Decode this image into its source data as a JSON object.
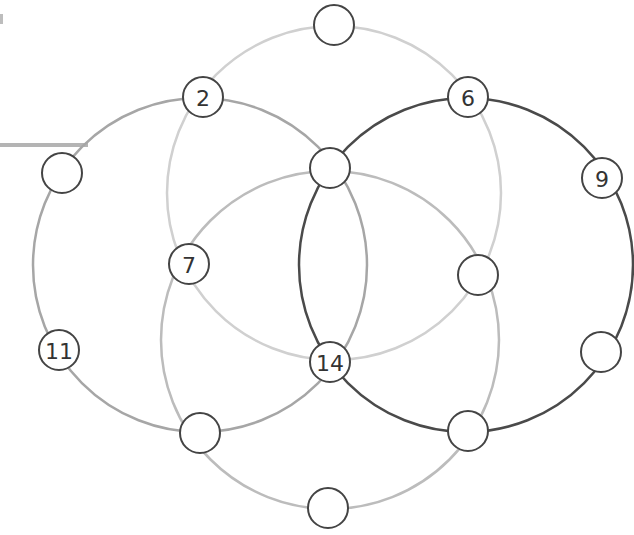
{
  "diagram": {
    "type": "magic-circles-puzzle",
    "canvas": {
      "width": 634,
      "height": 535,
      "background": "#ffffff"
    },
    "circles": [
      {
        "id": "top",
        "cx": 334,
        "cy": 193,
        "r": 167,
        "stroke": "#d0d0d0",
        "width": 2.5
      },
      {
        "id": "left",
        "cx": 200,
        "cy": 265,
        "r": 167,
        "stroke": "#a6a6a6",
        "width": 2.5
      },
      {
        "id": "bottom",
        "cx": 330,
        "cy": 340,
        "r": 169,
        "stroke": "#bcbcbc",
        "width": 2.5
      },
      {
        "id": "right",
        "cx": 466,
        "cy": 265,
        "r": 167,
        "stroke": "#4a4a4a",
        "width": 2.5
      }
    ],
    "stub_line": {
      "x1": 0,
      "y1": 145,
      "x2": 88,
      "y2": 145,
      "stroke": "#b4b4b4",
      "width": 4
    },
    "node_style": {
      "r": 20,
      "fill": "#ffffff",
      "stroke": "#444444",
      "width": 2
    },
    "nodes": [
      {
        "id": "n-top",
        "x": 334,
        "y": 25,
        "label": ""
      },
      {
        "id": "n-2",
        "x": 203,
        "y": 97,
        "label": "2"
      },
      {
        "id": "n-6",
        "x": 468,
        "y": 97,
        "label": "6"
      },
      {
        "id": "n-left",
        "x": 62,
        "y": 173,
        "label": ""
      },
      {
        "id": "n-center-top",
        "x": 330,
        "y": 168,
        "label": ""
      },
      {
        "id": "n-9",
        "x": 602,
        "y": 178,
        "label": "9"
      },
      {
        "id": "n-7",
        "x": 189,
        "y": 264,
        "label": "7"
      },
      {
        "id": "n-right-mid",
        "x": 478,
        "y": 275,
        "label": ""
      },
      {
        "id": "n-11",
        "x": 59,
        "y": 350,
        "label": "11"
      },
      {
        "id": "n-right-low",
        "x": 601,
        "y": 352,
        "label": ""
      },
      {
        "id": "n-14",
        "x": 330,
        "y": 362,
        "label": "14"
      },
      {
        "id": "n-bottom-left",
        "x": 200,
        "y": 433,
        "label": ""
      },
      {
        "id": "n-bottom-right",
        "x": 468,
        "y": 431,
        "label": ""
      },
      {
        "id": "n-bottom",
        "x": 328,
        "y": 508,
        "label": ""
      }
    ]
  }
}
